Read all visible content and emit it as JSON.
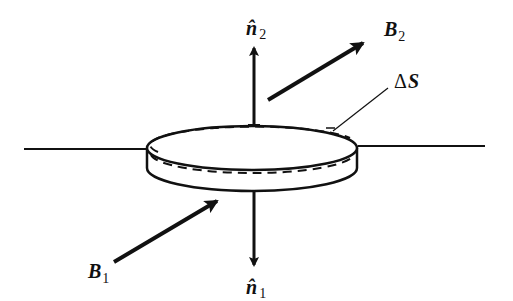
{
  "diagram": {
    "labels": {
      "n2": {
        "symbol": "n̂",
        "subscript": "2"
      },
      "n1": {
        "symbol": "n̂",
        "subscript": "1"
      },
      "b2": {
        "symbol": "B",
        "subscript": "2"
      },
      "b1": {
        "symbol": "B",
        "subscript": "1"
      },
      "surface": {
        "delta": "Δ",
        "symbol": "S"
      }
    },
    "colors": {
      "ink": "#111111",
      "background": "#ffffff"
    }
  }
}
